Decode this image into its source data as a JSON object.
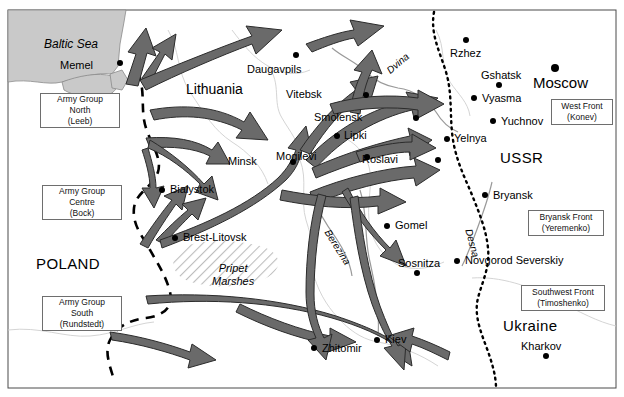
{
  "map": {
    "title": "Operation Barbarossa 1941 advance map",
    "frame": {
      "x": 8,
      "y": 10,
      "w": 608,
      "h": 378
    },
    "colors": {
      "sea": "#c9c9c9",
      "arrow": "#6a6a6a",
      "arrow_stroke": "#2b2b2b",
      "border_dashed": "#000000",
      "frontline_dotted": "#000000",
      "river": "#9a9a9a",
      "internal_border": "#bdbdbd",
      "marsh_hatch": "#bdbdbd",
      "box_border": "#6e6e6e",
      "land": "#ffffff"
    },
    "water": [
      {
        "name": "Baltic Sea",
        "label": "Baltic Sea",
        "x": 44,
        "y": 38
      }
    ],
    "rivers": [
      {
        "name": "Dvina",
        "label": "Dvina",
        "x": 385,
        "y": 68,
        "rotate": -40
      },
      {
        "name": "Berezina",
        "label": "Berezina",
        "x": 331,
        "y": 228,
        "rotate": 58
      },
      {
        "name": "Desna",
        "label": "Desna",
        "x": 473,
        "y": 228,
        "rotate": 75
      }
    ],
    "regions": [
      {
        "name": "Lithuania",
        "label": "Lithuania",
        "x": 186,
        "y": 82,
        "style": "region-label"
      },
      {
        "name": "POLAND",
        "label": "POLAND",
        "x": 36,
        "y": 256,
        "style": "country-big"
      },
      {
        "name": "USSR",
        "label": "USSR",
        "x": 500,
        "y": 150,
        "style": "country-big"
      },
      {
        "name": "Ukraine",
        "label": "Ukraine",
        "x": 503,
        "y": 318,
        "style": "country-big"
      }
    ],
    "marsh": {
      "name": "Pripet Marshes",
      "line1": "Pripet",
      "line2": "Marshes",
      "x": 212,
      "y": 262
    },
    "cities": [
      {
        "name": "Memel",
        "label": "Memel",
        "dot_x": 120,
        "dot_y": 63,
        "label_x": 55,
        "label_y": 60,
        "anchor": "right"
      },
      {
        "name": "Daugavpils",
        "label": "Daugavpils",
        "dot_x": 296,
        "dot_y": 55,
        "label_x": 247,
        "label_y": 64,
        "anchor": "left"
      },
      {
        "name": "Vitebsk",
        "label": "Vitebsk",
        "dot_x": 366,
        "dot_y": 95,
        "label_x": 322,
        "label_y": 89,
        "anchor": "right"
      },
      {
        "name": "Smolensk",
        "label": "Smolensk",
        "dot_x": 416,
        "dot_y": 118,
        "label_x": 362,
        "label_y": 112,
        "anchor": "right"
      },
      {
        "name": "Lipki",
        "label": "Lipki",
        "dot_x": 337,
        "dot_y": 136,
        "label_x": 344,
        "label_y": 130,
        "anchor": "left"
      },
      {
        "name": "Mogilevi",
        "label": "Mogilevi",
        "dot_x": 367,
        "dot_y": 157,
        "label_x": 316,
        "label_y": 151,
        "anchor": "right"
      },
      {
        "name": "Minsk",
        "label": "Minsk",
        "dot_x": 293,
        "dot_y": 162,
        "label_x": 257,
        "label_y": 156,
        "anchor": "right"
      },
      {
        "name": "Roslavi",
        "label": "Roslavi",
        "dot_x": 438,
        "dot_y": 160,
        "label_x": 398,
        "label_y": 154,
        "anchor": "right"
      },
      {
        "name": "Yelnya",
        "label": "Yelnya",
        "dot_x": 447,
        "dot_y": 139,
        "label_x": 454,
        "label_y": 133,
        "anchor": "left"
      },
      {
        "name": "Rzhez",
        "label": "Rzhez",
        "dot_x": 466,
        "dot_y": 40,
        "label_x": 450,
        "label_y": 48,
        "anchor": "left"
      },
      {
        "name": "Moscow",
        "label": "Moscow",
        "dot_x": 555,
        "dot_y": 68,
        "label_x": 533,
        "label_y": 75,
        "anchor": "left"
      },
      {
        "name": "Gshatsk",
        "label": "Gshatsk",
        "dot_x": 499,
        "dot_y": 85,
        "label_x": 481,
        "label_y": 70,
        "anchor": "left"
      },
      {
        "name": "Vyasma",
        "label": "Vyasma",
        "dot_x": 474,
        "dot_y": 98,
        "label_x": 482,
        "label_y": 93,
        "anchor": "left"
      },
      {
        "name": "Yuchnov",
        "label": "Yuchnov",
        "dot_x": 493,
        "dot_y": 121,
        "label_x": 501,
        "label_y": 116,
        "anchor": "left"
      },
      {
        "name": "Bialystok",
        "label": "Bialystok",
        "dot_x": 162,
        "dot_y": 190,
        "label_x": 170,
        "label_y": 184,
        "anchor": "left"
      },
      {
        "name": "Brest-Litovsk",
        "label": "Brest-Litovsk",
        "dot_x": 175,
        "dot_y": 238,
        "label_x": 183,
        "label_y": 232,
        "anchor": "left"
      },
      {
        "name": "Bryansk",
        "label": "Bryansk",
        "dot_x": 485,
        "dot_y": 195,
        "label_x": 493,
        "label_y": 190,
        "anchor": "left"
      },
      {
        "name": "Gomel",
        "label": "Gomel",
        "dot_x": 387,
        "dot_y": 226,
        "label_x": 395,
        "label_y": 220,
        "anchor": "left"
      },
      {
        "name": "Sosnitza",
        "label": "Sosnitza",
        "dot_x": 417,
        "dot_y": 273,
        "label_x": 398,
        "label_y": 258,
        "anchor": "left"
      },
      {
        "name": "Novgorod Severskiy",
        "label": "Novgorod Severskiy",
        "dot_x": 457,
        "dot_y": 261,
        "label_x": 465,
        "label_y": 255,
        "anchor": "left"
      },
      {
        "name": "Kiev",
        "label": "Kiev",
        "dot_x": 377,
        "dot_y": 340,
        "label_x": 385,
        "label_y": 334,
        "anchor": "left"
      },
      {
        "name": "Zhitomir",
        "label": "Zhitomir",
        "dot_x": 314,
        "dot_y": 348,
        "label_x": 322,
        "label_y": 343,
        "anchor": "left"
      },
      {
        "name": "Kharkov",
        "label": "Kharkov",
        "dot_x": 546,
        "dot_y": 356,
        "label_x": 521,
        "label_y": 341,
        "anchor": "left"
      }
    ],
    "german_army_groups": [
      {
        "name": "army-group-north",
        "line1": "Army Group",
        "line2": "North",
        "line3": "(Leeb)",
        "x": 40,
        "y": 93,
        "w": 80,
        "h": 35
      },
      {
        "name": "army-group-centre",
        "line1": "Army Group",
        "line2": "Centre",
        "line3": "(Bock)",
        "x": 42,
        "y": 185,
        "w": 80,
        "h": 35
      },
      {
        "name": "army-group-south",
        "line1": "Army Group",
        "line2": "South",
        "line3": "(Rundstedt)",
        "x": 42,
        "y": 296,
        "w": 80,
        "h": 35
      }
    ],
    "soviet_fronts": [
      {
        "name": "west-front",
        "line1": "West Front",
        "line2": "(Konev)",
        "x": 551,
        "y": 99,
        "w": 62,
        "h": 26
      },
      {
        "name": "bryansk-front",
        "line1": "Bryansk Front",
        "line2": "(Yeremenko)",
        "x": 528,
        "y": 210,
        "w": 76,
        "h": 26
      },
      {
        "name": "southwest-front",
        "line1": "Southwest Front",
        "line2": "(Timoshenko)",
        "x": 521,
        "y": 285,
        "w": 84,
        "h": 26
      }
    ]
  }
}
